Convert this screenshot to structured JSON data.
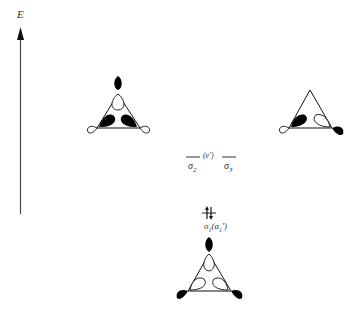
{
  "axis": {
    "label": "E"
  },
  "levels": {
    "degenerate": {
      "left": "σ",
      "left_sub": "2",
      "middle": "(e′)",
      "right": "σ",
      "right_sub": "3"
    },
    "lowest": {
      "electrons": "⥮",
      "label_main": "σ",
      "label_sub": "1",
      "label_sym": "(a",
      "label_sym_sub": "1",
      "label_sym_end": "′)"
    }
  },
  "orbitals": [
    {
      "name": "sigma2-orbital",
      "position": "top-left"
    },
    {
      "name": "sigma3-orbital",
      "position": "top-right"
    },
    {
      "name": "sigma1-orbital",
      "position": "bottom-center"
    }
  ],
  "colors": {
    "ink": "#000000",
    "paper": "#ffffff",
    "text": "#333333"
  }
}
